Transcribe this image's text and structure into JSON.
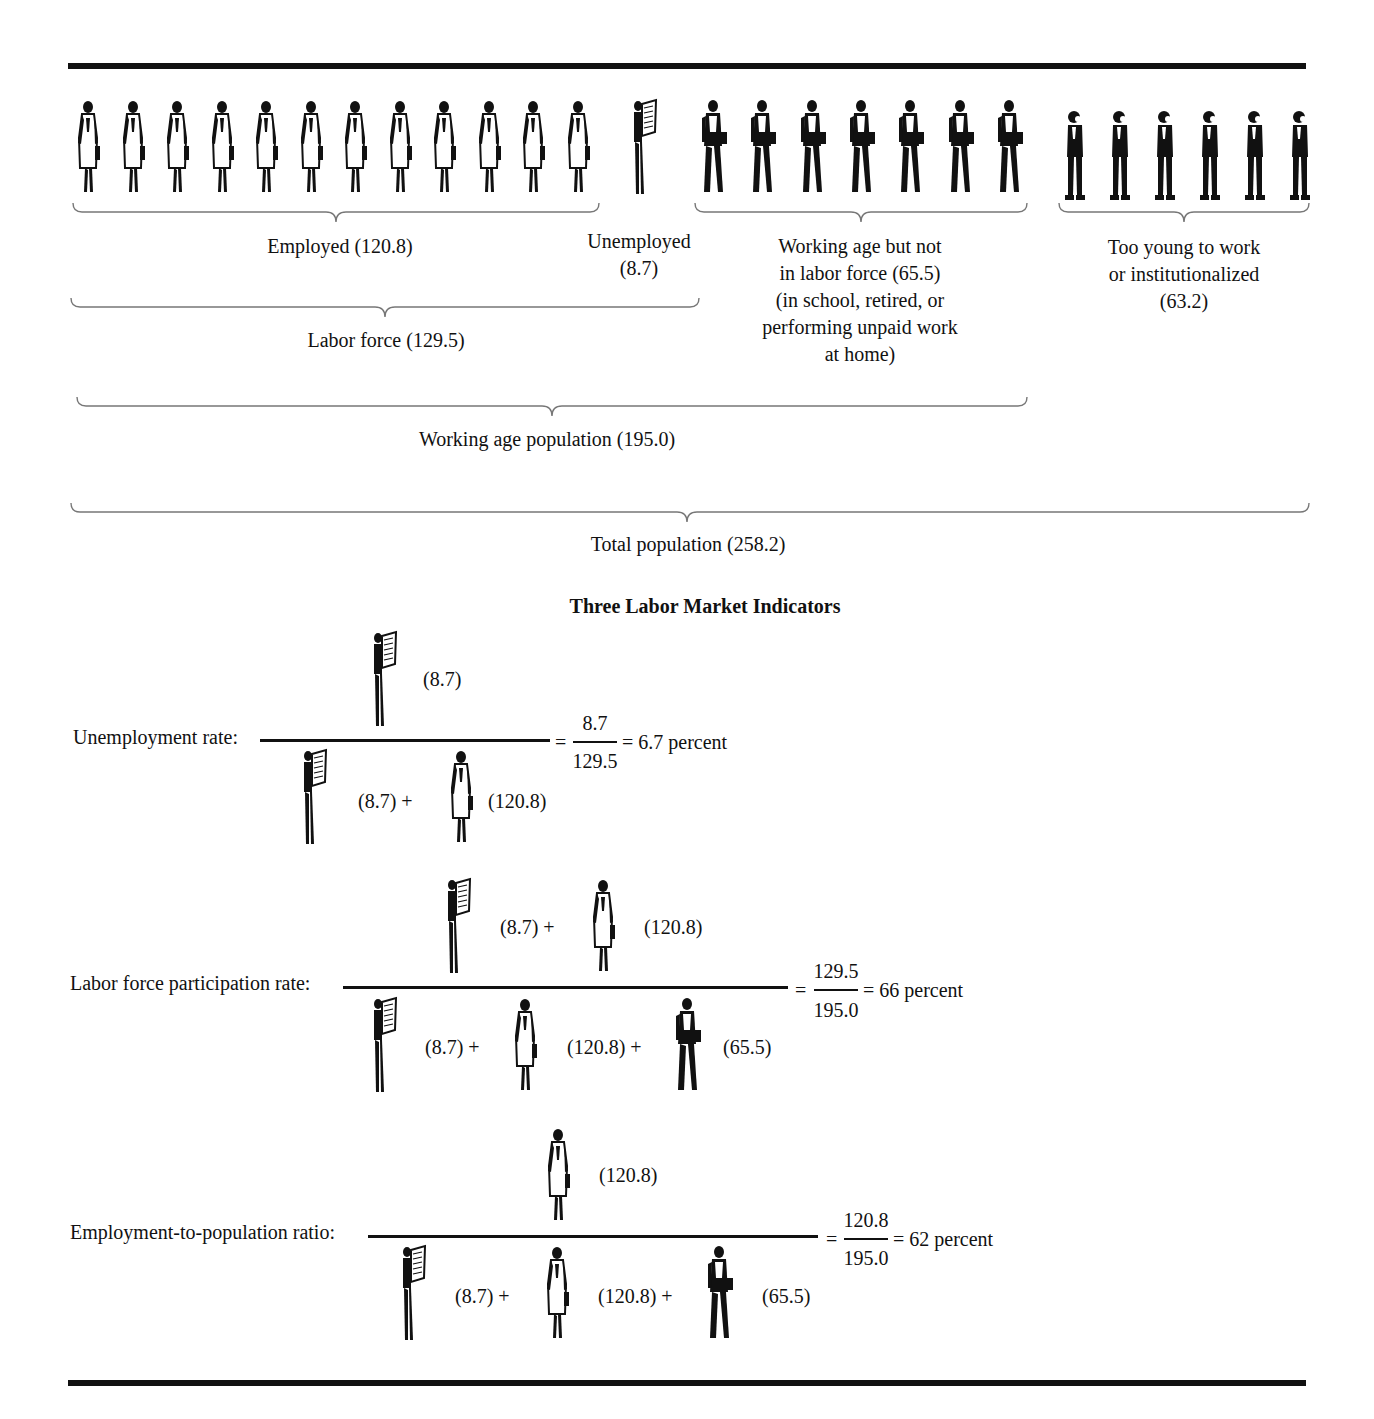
{
  "diagram": {
    "figure_counts": {
      "employed": 12,
      "unemployed": 1,
      "not_in_labor_force": 7,
      "too_young": 6
    },
    "groups": {
      "employed": {
        "label": "Employed (120.8)",
        "value": 120.8
      },
      "unemployed": {
        "line1": "Unemployed",
        "line2": "(8.7)",
        "value": 8.7
      },
      "not_in_labor_force": {
        "lines": [
          "Working age but not",
          "in labor force (65.5)",
          "(in school, retired, or",
          "performing unpaid work",
          "at home)"
        ],
        "value": 65.5
      },
      "too_young": {
        "lines": [
          "Too young to work",
          "or institutionalized",
          "(63.2)"
        ],
        "value": 63.2
      },
      "labor_force": {
        "label": "Labor force (129.5)",
        "value": 129.5
      },
      "working_age": {
        "label": "Working age population (195.0)",
        "value": 195.0
      },
      "total": {
        "label": "Total population (258.2)",
        "value": 258.2
      }
    },
    "indicators_title": "Three Labor Market Indicators",
    "indicators": [
      {
        "label": "Unemployment rate:",
        "numerator": [
          {
            "icon": "unemployed",
            "value": "(8.7)"
          }
        ],
        "denominator": [
          {
            "icon": "unemployed",
            "value": "(8.7) +"
          },
          {
            "icon": "employed",
            "value": "(120.8)"
          }
        ],
        "equals": "=",
        "frac_num": "8.7",
        "frac_den": "129.5",
        "result": "= 6.7 percent"
      },
      {
        "label": "Labor force participation rate:",
        "numerator": [
          {
            "icon": "unemployed",
            "value": "(8.7) +"
          },
          {
            "icon": "employed",
            "value": "(120.8)"
          }
        ],
        "denominator": [
          {
            "icon": "unemployed",
            "value": "(8.7) +"
          },
          {
            "icon": "employed",
            "value": "(120.8) +"
          },
          {
            "icon": "not_in_lf",
            "value": "(65.5)"
          }
        ],
        "equals": "=",
        "frac_num": "129.5",
        "frac_den": "195.0",
        "result": "= 66 percent"
      },
      {
        "label": "Employment-to-population ratio:",
        "numerator": [
          {
            "icon": "employed",
            "value": "(120.8)"
          }
        ],
        "denominator": [
          {
            "icon": "unemployed",
            "value": "(8.7) +"
          },
          {
            "icon": "employed",
            "value": "(120.8) +"
          },
          {
            "icon": "not_in_lf",
            "value": "(65.5)"
          }
        ],
        "equals": "=",
        "frac_num": "120.8",
        "frac_den": "195.0",
        "result": "= 62 percent"
      }
    ]
  }
}
